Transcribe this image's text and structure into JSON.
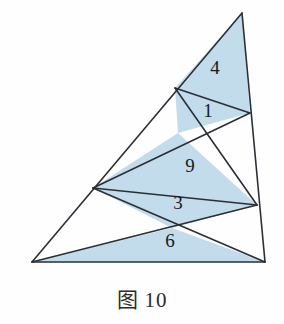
{
  "figure": {
    "caption_label": "图",
    "caption_number": "10",
    "caption_full": "图 10",
    "fill_color": "#c3dcec",
    "line_color": "#2a2f35",
    "background_color": "#fefefe",
    "outline": {
      "apex": [
        242,
        13
      ],
      "bottom_left": [
        32,
        262
      ],
      "bottom_right": [
        265,
        262
      ]
    },
    "interior_points": {
      "left_edge_upper": [
        175,
        88
      ],
      "right_edge_upper": [
        250,
        113
      ],
      "left_edge_mid": [
        93,
        188
      ],
      "right_edge_mid": [
        257,
        205
      ],
      "cross_upper": [
        178,
        133
      ],
      "cross_lower": [
        172,
        228
      ]
    },
    "regions": [
      {
        "name": "region-4",
        "label": "4",
        "shaded": true,
        "label_pos": [
          215,
          70
        ],
        "points": "242,13 175,88 250,113"
      },
      {
        "name": "region-1",
        "label": "1",
        "shaded": true,
        "label_pos": [
          208,
          113
        ],
        "points": "175,88 250,113 178,133"
      },
      {
        "name": "region-9",
        "label": "9",
        "shaded": true,
        "label_pos": [
          190,
          168
        ],
        "points": "178,133 257,205 93,188"
      },
      {
        "name": "region-3",
        "label": "3",
        "shaded": true,
        "label_pos": [
          178,
          205
        ],
        "points": "93,188 257,205 172,228"
      },
      {
        "name": "region-6",
        "label": "6",
        "shaded": true,
        "label_pos": [
          170,
          243
        ],
        "points": "32,262 172,228 265,262"
      }
    ],
    "lines": [
      {
        "name": "edge-left",
        "points": "242,13 32,262"
      },
      {
        "name": "edge-right",
        "points": "242,13 265,262"
      },
      {
        "name": "edge-bottom",
        "points": "32,262 265,262"
      },
      {
        "name": "cevian-left-upper-to-right-upper",
        "points": "175,88 250,113"
      },
      {
        "name": "cevian-apex-left-to-right-mid",
        "points": "175,88 257,205"
      },
      {
        "name": "cevian-right-upper-to-left-mid",
        "points": "250,113 93,188"
      },
      {
        "name": "cevian-left-mid-to-right-mid",
        "points": "93,188 257,205"
      },
      {
        "name": "cevian-left-mid-to-bottom-right",
        "points": "93,188 265,262"
      },
      {
        "name": "cevian-bottom-left-to-right-mid",
        "points": "32,262 257,205"
      }
    ],
    "area_values": [
      4,
      1,
      9,
      3,
      6
    ]
  }
}
